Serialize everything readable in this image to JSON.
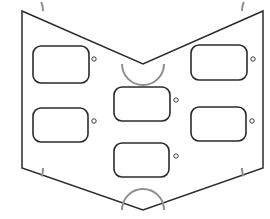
{
  "drawing": {
    "title": "Chevron Panel Outline",
    "type": "technical-line-drawing",
    "canvas": {
      "width": 270,
      "height": 219,
      "background": "#ffffff"
    },
    "colors": {
      "outline_stroke": "#2b2b2e",
      "arc_stroke": "#8e8e92",
      "cutout_stroke": "#2b2b2e",
      "hole_stroke": "#3a3a3e",
      "fill": "#ffffff"
    },
    "outline": {
      "name": "panel-outline",
      "description": "Chevron / arrowhead shaped plate",
      "vertices": [
        {
          "label": "top-left",
          "x": 22,
          "y": 11
        },
        {
          "label": "top-notch-apex",
          "x": 143,
          "y": 64
        },
        {
          "label": "top-right",
          "x": 263,
          "y": 11
        },
        {
          "label": "bottom-right",
          "x": 263,
          "y": 168
        },
        {
          "label": "bottom-apex",
          "x": 143,
          "y": 210
        },
        {
          "label": "bottom-left",
          "x": 22,
          "y": 168
        }
      ],
      "path": "M 22 11 L 143 64 L 263 11 L 263 168 L 143 210 L 22 168 Z"
    },
    "corner_arcs": [
      {
        "name": "corner-arc-top-left",
        "cx": 22,
        "cy": 11,
        "r": 21,
        "start_deg": 0,
        "end_deg": 24,
        "path": "M 43 11 A 21 21 0 0 0 41.2 2.0"
      },
      {
        "name": "corner-arc-top-right",
        "cx": 263,
        "cy": 11,
        "r": 21,
        "start_deg": 156,
        "end_deg": 180,
        "path": "M 242 11 A 21 21 0 0 1 243.8 2.0"
      },
      {
        "name": "corner-arc-bottom-left",
        "cx": 22,
        "cy": 168,
        "r": 21,
        "start_deg": 0,
        "end_deg": 22,
        "path": "M 43 168 A 21 21 0 0 1 41.6 176.4"
      },
      {
        "name": "corner-arc-bottom-right",
        "cx": 263,
        "cy": 168,
        "r": 21,
        "start_deg": 158,
        "end_deg": 180,
        "path": "M 242 168 A 21 21 0 0 0 243.4 176.4"
      }
    ],
    "notch_arcs": [
      {
        "name": "notch-arc-top-center",
        "cx": 143,
        "cy": 64,
        "r": 21,
        "orientation": "opens-upward",
        "path": "M 122 64 A 21 21 0 0 0 164 64"
      },
      {
        "name": "notch-arc-bottom-center",
        "cx": 143,
        "cy": 210,
        "r": 21,
        "orientation": "opens-downward",
        "path": "M 122 210 A 21 21 0 0 1 164 210"
      }
    ],
    "cutouts": [
      {
        "name": "cutout-top-left",
        "x": 33,
        "y": 46,
        "width": 56,
        "height": 37,
        "rx": 8
      },
      {
        "name": "cutout-top-right",
        "x": 191,
        "y": 45,
        "width": 56,
        "height": 35,
        "rx": 8
      },
      {
        "name": "cutout-middle-center",
        "x": 114,
        "y": 87,
        "width": 56,
        "height": 34,
        "rx": 8
      },
      {
        "name": "cutout-bottom-left",
        "x": 33,
        "y": 108,
        "width": 55,
        "height": 34,
        "rx": 8
      },
      {
        "name": "cutout-bottom-right",
        "x": 191,
        "y": 107,
        "width": 55,
        "height": 34,
        "rx": 8
      },
      {
        "name": "cutout-lower-center",
        "x": 114,
        "y": 143,
        "width": 55,
        "height": 34,
        "rx": 8
      }
    ],
    "holes": [
      {
        "name": "hole-top-left",
        "cx": 94,
        "cy": 59,
        "r": 2.2
      },
      {
        "name": "hole-top-right",
        "cx": 253,
        "cy": 59,
        "r": 2.2
      },
      {
        "name": "hole-middle-center",
        "cx": 176,
        "cy": 100,
        "r": 2.2
      },
      {
        "name": "hole-bottom-left",
        "cx": 94,
        "cy": 121,
        "r": 2.2
      },
      {
        "name": "hole-bottom-right",
        "cx": 252,
        "cy": 121,
        "r": 2.2
      },
      {
        "name": "hole-lower-center",
        "cx": 176,
        "cy": 156,
        "r": 2.2
      }
    ]
  }
}
